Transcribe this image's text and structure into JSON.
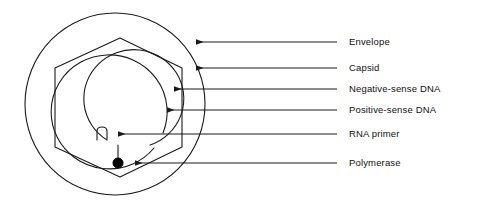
{
  "figure": {
    "canvas": {
      "width": 500,
      "height": 209,
      "background": "#ffffff"
    },
    "line_color": "#1a1a1a",
    "text_color": "#111111"
  },
  "labels": [
    {
      "id": "envelope",
      "text": "Envelope",
      "text_x": 349,
      "text_y": 42,
      "leader_x1": 337,
      "leader_x2": 196,
      "leader_y": 42,
      "arrow_x": 193,
      "arrow_y": 41
    },
    {
      "id": "capsid",
      "text": "Capsid",
      "text_x": 349,
      "text_y": 68,
      "leader_x1": 337,
      "leader_x2": 196,
      "leader_y": 68,
      "arrow_x": 193,
      "arrow_y": 68
    },
    {
      "id": "negative-sense-dna",
      "text": "Negative-sense DNA",
      "text_x": 349,
      "text_y": 89,
      "leader_x1": 337,
      "leader_x2": 174,
      "leader_y": 89,
      "arrow_x": 170,
      "arrow_y": 89
    },
    {
      "id": "positive-sense-dna",
      "text": "Positive-sense DNA",
      "text_x": 349,
      "text_y": 110,
      "leader_x1": 337,
      "leader_x2": 167,
      "leader_y": 110,
      "arrow_x": 163,
      "arrow_y": 110
    },
    {
      "id": "rna-primer",
      "text": "RNA primer",
      "text_x": 349,
      "text_y": 134,
      "leader_x1": 337,
      "leader_x2": 118,
      "leader_y": 134,
      "arrow_x": 113,
      "arrow_y": 134
    },
    {
      "id": "polymerase",
      "text": "Polymerase",
      "text_x": 349,
      "text_y": 163,
      "leader_x1": 337,
      "leader_x2": 135,
      "leader_y": 163,
      "arrow_x": 130,
      "arrow_y": 163
    }
  ],
  "shapes": {
    "envelope": {
      "name": "envelope-circle",
      "cx": 115,
      "cy": 104,
      "rx": 90,
      "ry": 91
    },
    "capsid": {
      "name": "capsid-hexagon",
      "points": "120,38 182,68 182,147 120,177 55,147 55,68"
    },
    "negative_sense_dna": {
      "name": "negative-sense-dna-strand",
      "path": "M 154 148 A 58 57 0 1 1 163 133"
    },
    "positive_sense_dna": {
      "name": "positive-sense-dna-strand",
      "path": "M 107 140 A 50 49 0 1 1 150 145"
    },
    "rna_primer": {
      "name": "rna-primer-glyph",
      "path": "M 97 140 L 97 131 Q 97 127 102 127 Q 107 127 107 131 L 107 139"
    },
    "primer_tail": {
      "name": "primer-to-polymerase-connector",
      "path": "M 118 158 L 118 145"
    },
    "polymerase": {
      "name": "polymerase-dot",
      "cx": 118,
      "cy": 163,
      "r": 5
    }
  }
}
